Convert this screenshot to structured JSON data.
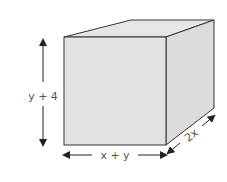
{
  "diagram": {
    "type": "rectangular-prism",
    "colors": {
      "face": "#e2e2e2",
      "face_top": "#e6e6e6",
      "face_side": "#dcdcdc",
      "edge": "#333333",
      "arrow": "#222222",
      "text": "#555555"
    },
    "labels": {
      "height": "y + 4",
      "width": "x + y",
      "depth": "2x"
    }
  }
}
